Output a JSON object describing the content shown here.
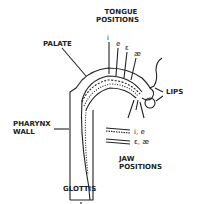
{
  "labels": {
    "tongue_positions_line1": "TONGUE",
    "tongue_positions_line2": "POSITIONS",
    "palate": "PALATE",
    "lips": "LIPS",
    "pharynx_line1": "PHARYNX",
    "pharynx_line2": "WALL",
    "jaw_line1": "JAW",
    "jaw_line2": "POSITIONS",
    "glottis": "GLOTTIS"
  },
  "vowels": {
    "i": "i",
    "e": "e",
    "epsilon": "ε",
    "ae": "æ"
  },
  "jaw_legend": {
    "dotted": "i, e",
    "double": "ε, æ"
  },
  "colors": {
    "ink": "#222222",
    "background": "#ffffff"
  }
}
